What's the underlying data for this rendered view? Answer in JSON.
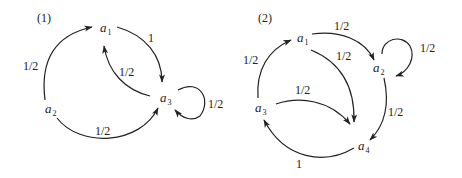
{
  "diagrams": [
    {
      "title": "(1)",
      "nodes": [
        {
          "id": "a1",
          "base": "a",
          "sub": "1"
        },
        {
          "id": "a2",
          "base": "a",
          "sub": "2"
        },
        {
          "id": "a3",
          "base": "a",
          "sub": "3"
        }
      ],
      "edges": [
        {
          "from": "a2",
          "to": "a1",
          "label": "1/2"
        },
        {
          "from": "a1",
          "to": "a3",
          "label": "1"
        },
        {
          "from": "a3",
          "to": "a1",
          "label": "1/2"
        },
        {
          "from": "a2",
          "to": "a3",
          "label": "1/2"
        },
        {
          "from": "a3",
          "to": "a3",
          "label": "1/2"
        }
      ]
    },
    {
      "title": "(2)",
      "nodes": [
        {
          "id": "a1",
          "base": "a",
          "sub": "1"
        },
        {
          "id": "a2",
          "base": "a",
          "sub": "2"
        },
        {
          "id": "a3",
          "base": "a",
          "sub": "3"
        },
        {
          "id": "a4",
          "base": "a",
          "sub": "4"
        }
      ],
      "edges": [
        {
          "from": "a1",
          "to": "a2",
          "label": "1/2"
        },
        {
          "from": "a1",
          "to": "a4",
          "label": "1/2"
        },
        {
          "from": "a2",
          "to": "a2",
          "label": "1/2"
        },
        {
          "from": "a2",
          "to": "a4",
          "label": "1/2"
        },
        {
          "from": "a3",
          "to": "a1",
          "label": "1/2"
        },
        {
          "from": "a3",
          "to": "a4",
          "label": "1/2"
        },
        {
          "from": "a4",
          "to": "a3",
          "label": "1"
        }
      ]
    }
  ]
}
